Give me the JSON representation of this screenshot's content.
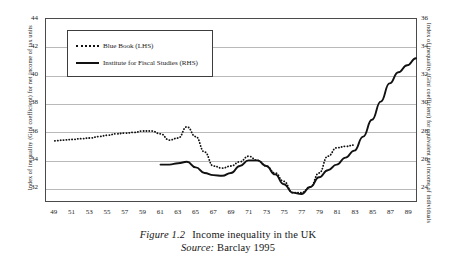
{
  "caption": {
    "figure_label": "Figure 1.2",
    "title": "Income inequality in the UK",
    "source_label": "Source:",
    "source_value": "Barclay 1995"
  },
  "legend": {
    "items": [
      {
        "label": "Blue Book (LHS)",
        "style": "dotted"
      },
      {
        "label": "Institute for Fiscal Studies (RHS)",
        "style": "solid"
      }
    ]
  },
  "chart_data": {
    "type": "line",
    "title": "Income inequality in the UK",
    "xlabel": "",
    "ylabel": "Index of inequality (Gini coefficient) for net income of tax units",
    "ylabel_right": "Index of inequality (Gini coefficient) for equivalent net income of individuals",
    "grid": true,
    "legend_position": "upper-left-inside",
    "xlim": [
      48,
      90
    ],
    "ylim": [
      31,
      44
    ],
    "ylim_right": [
      23,
      36
    ],
    "xticks": [
      49,
      51,
      53,
      55,
      57,
      59,
      61,
      63,
      65,
      67,
      69,
      71,
      73,
      75,
      77,
      79,
      81,
      83,
      85,
      87,
      89
    ],
    "yticks_left": [
      32,
      34,
      36,
      38,
      40,
      42,
      44
    ],
    "yticks_right": [
      24,
      26,
      28,
      30,
      32,
      34,
      36
    ],
    "series": [
      {
        "name": "Blue Book (LHS)",
        "axis": "left",
        "style": "dotted",
        "x": [
          49,
          50,
          51,
          52,
          53,
          54,
          55,
          56,
          57,
          58,
          59,
          60,
          61,
          62,
          63,
          64,
          65,
          66,
          67,
          68,
          69,
          70,
          71,
          72,
          73,
          74,
          75,
          76,
          77,
          78,
          79,
          80,
          81,
          82,
          83
        ],
        "values": [
          35.3,
          35.35,
          35.4,
          35.45,
          35.5,
          35.6,
          35.7,
          35.8,
          35.85,
          35.9,
          36.0,
          36.0,
          35.8,
          35.35,
          35.5,
          36.3,
          35.6,
          34.5,
          33.5,
          33.35,
          33.5,
          33.8,
          34.2,
          33.9,
          33.5,
          33.0,
          32.4,
          31.6,
          31.6,
          32.0,
          33.0,
          34.2,
          34.8,
          34.9,
          35.0
        ]
      },
      {
        "name": "Institute for Fiscal Studies (RHS)",
        "axis": "right",
        "style": "solid",
        "x": [
          61,
          62,
          63,
          64,
          65,
          66,
          67,
          68,
          69,
          70,
          71,
          72,
          73,
          74,
          75,
          76,
          77,
          78,
          79,
          80,
          81,
          82,
          83,
          84,
          85,
          86,
          87,
          88,
          89,
          90
        ],
        "values": [
          25.6,
          25.6,
          25.7,
          25.8,
          25.4,
          25.0,
          24.85,
          24.8,
          25.0,
          25.5,
          25.9,
          25.9,
          25.5,
          24.9,
          24.2,
          23.6,
          23.5,
          24.0,
          24.7,
          25.2,
          25.6,
          26.1,
          26.6,
          27.6,
          28.8,
          30.1,
          31.4,
          32.2,
          32.7,
          33.2
        ]
      }
    ]
  }
}
